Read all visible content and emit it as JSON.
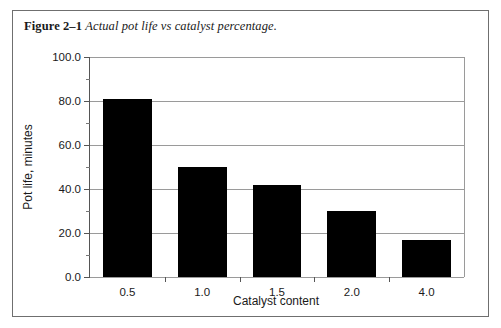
{
  "figure": {
    "caption_label": "Figure 2–1",
    "caption_text": "Actual pot life vs catalyst percentage."
  },
  "chart_data": {
    "type": "bar",
    "title": "Actual pot life vs catalyst percentage.",
    "categories": [
      "0.5",
      "1.0",
      "1.5",
      "2.0",
      "4.0"
    ],
    "values": [
      81,
      50,
      42,
      30,
      17
    ],
    "xlabel": "Catalyst content",
    "ylabel": "Pot life, minutes",
    "ylim": [
      0,
      100
    ],
    "ytick_labels": [
      "0.0",
      "20.0",
      "40.0",
      "60.0",
      "80.0",
      "100.0"
    ],
    "ytick_values": [
      0,
      20,
      40,
      60,
      80,
      100
    ],
    "yminor_values": [
      10,
      30,
      50,
      70,
      90
    ],
    "grid": "horizontal",
    "legend": "none",
    "bar_color": "#000000",
    "grid_color": "#9a9a9a",
    "axis_color": "#555555"
  }
}
